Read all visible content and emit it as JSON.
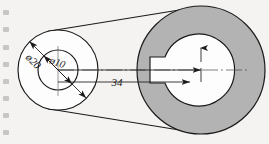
{
  "drawing": {
    "title": "pulley-belt-assembly-drawing",
    "background_color": "#f4f3f1",
    "line_color": "#1a1a1a",
    "ring_fill_color": "#b3b3b3",
    "bore_fill_color": "#fdfdfd",
    "small_pulley": {
      "name": "small-pulley",
      "center_x": 58,
      "center_y": 70,
      "outer_radius": 40,
      "inner_radius": 20,
      "outer_diameter_label": "ø20",
      "inner_diameter_label": "ø10"
    },
    "large_pulley": {
      "name": "large-pulley",
      "center_x": 201,
      "center_y": 70,
      "outer_radius": 64,
      "inner_radius": 36,
      "keyway_width": 22,
      "keyway_height": 26
    },
    "center_distance": {
      "label": "34",
      "text_x": 117,
      "text_y": 86
    },
    "belt": {
      "name": "belt-tangent-lines",
      "upper": "tangent-upper",
      "lower": "tangent-lower"
    },
    "edge_marks": [
      {
        "top": 10
      },
      {
        "top": 27
      },
      {
        "top": 45
      },
      {
        "top": 62
      },
      {
        "top": 79
      },
      {
        "top": 96
      },
      {
        "top": 113
      },
      {
        "top": 130
      }
    ]
  }
}
